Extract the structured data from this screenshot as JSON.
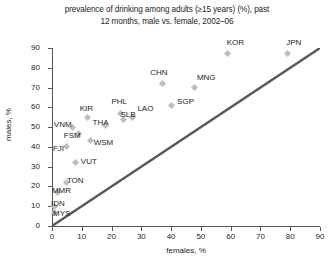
{
  "chart_data": {
    "type": "scatter",
    "title": "prevalence of drinking among adults (≥15 years) (%), past\n12 months, male vs. female, 2002–06",
    "title_line1": "prevalence of drinking among adults (≥15 years) (%), past",
    "title_line2": "12 months, male vs. female, 2002–06",
    "xlabel": "females, %",
    "ylabel": "males, %",
    "xlim": [
      0,
      90
    ],
    "ylim": [
      0,
      90
    ],
    "xticks": [
      0,
      10,
      20,
      30,
      40,
      50,
      60,
      70,
      80,
      90
    ],
    "yticks": [
      0,
      10,
      20,
      30,
      40,
      50,
      60,
      70,
      80,
      90
    ],
    "grid": false,
    "legend": "none",
    "marker_color": "#bcbec0",
    "reference_line": {
      "name": "identity-line",
      "description": "y = x diagonal",
      "color": "#58595b",
      "from": [
        0,
        0
      ],
      "to": [
        90,
        90
      ]
    },
    "points": [
      {
        "label": "KOR",
        "x": 59,
        "y": 87,
        "label_dx": -1,
        "label_dy": -12
      },
      {
        "label": "JPN",
        "x": 79,
        "y": 87,
        "label_dx": -1,
        "label_dy": -12
      },
      {
        "label": "CHN",
        "x": 37,
        "y": 72,
        "label_dx": -12,
        "label_dy": -12
      },
      {
        "label": "MNG",
        "x": 48,
        "y": 70,
        "label_dx": 2,
        "label_dy": -11
      },
      {
        "label": "SGP",
        "x": 40,
        "y": 61,
        "label_dx": 6,
        "label_dy": -4
      },
      {
        "label": "PHL",
        "x": 23,
        "y": 57,
        "label_dx": -9,
        "label_dy": -12
      },
      {
        "label": "LAO",
        "x": 27,
        "y": 55,
        "label_dx": 5,
        "label_dy": -9
      },
      {
        "label": "SLB",
        "x": 24,
        "y": 54,
        "label_dx": -3,
        "label_dy": -5
      },
      {
        "label": "KIR",
        "x": 12,
        "y": 55,
        "label_dx": -8,
        "label_dy": -9
      },
      {
        "label": "THA",
        "x": 18,
        "y": 51,
        "label_dx": -13,
        "label_dy": -3
      },
      {
        "label": "VNM",
        "x": 7,
        "y": 50,
        "label_dx": -19,
        "label_dy": -3
      },
      {
        "label": "FSM",
        "x": 9,
        "y": 47,
        "label_dx": -15,
        "label_dy": 2
      },
      {
        "label": "WSM",
        "x": 13,
        "y": 43,
        "label_dx": 3,
        "label_dy": 1
      },
      {
        "label": "FJI",
        "x": 5,
        "y": 40,
        "label_dx": -14,
        "label_dy": 1
      },
      {
        "label": "VUT",
        "x": 8,
        "y": 32,
        "label_dx": 5,
        "label_dy": -2
      },
      {
        "label": "TON",
        "x": 5,
        "y": 22,
        "label_dx": 0,
        "label_dy": -2
      },
      {
        "label": "MMR",
        "x": 2,
        "y": 17,
        "label_dx": -6,
        "label_dy": -2
      },
      {
        "label": "IDN",
        "x": 1,
        "y": 10,
        "label_dx": -4,
        "label_dy": -3
      },
      {
        "label": "MYS",
        "x": 1,
        "y": 7,
        "label_dx": -2,
        "label_dy": 1
      }
    ]
  }
}
